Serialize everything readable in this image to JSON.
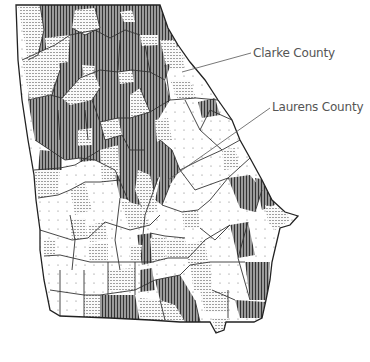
{
  "map": {
    "subject": "Georgia counties",
    "patterns": {
      "dark": {
        "name": "vertical-stripes",
        "fill": "#8a8a8a"
      },
      "medium": {
        "name": "horizontal-dotted-lines",
        "fill": "#e8e8e8"
      },
      "light": {
        "name": "sparse-dots",
        "fill": "#ffffff"
      }
    },
    "border_color": "#333333"
  },
  "annotations": [
    {
      "id": "clarke",
      "label": "Clarke County"
    },
    {
      "id": "laurens",
      "label": "Laurens County"
    }
  ]
}
